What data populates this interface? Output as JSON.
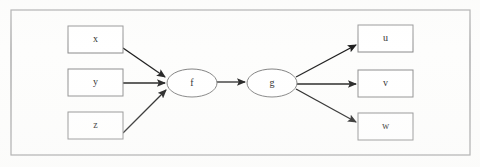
{
  "diagram": {
    "frame": {
      "name": "outer-border",
      "x": 11,
      "y": 10,
      "width": 459,
      "height": 145,
      "stroke": "#9a9a9a"
    },
    "colors": {
      "background": "#fdfdfc",
      "node_fill": "#ffffff",
      "node_stroke": "#8a8a8a",
      "ellipse_stroke": "#7d7d7d",
      "edge": "#1b1b1b",
      "label_text": "#1d1d1d"
    },
    "inputs": [
      {
        "id": "x",
        "label": "x",
        "shape": "rect",
        "x": 68,
        "y": 26,
        "width": 55,
        "height": 27
      },
      {
        "id": "y",
        "label": "y",
        "shape": "rect",
        "x": 68,
        "y": 69,
        "width": 55,
        "height": 27
      },
      {
        "id": "z",
        "label": "z",
        "shape": "rect",
        "x": 68,
        "y": 112,
        "width": 55,
        "height": 27
      }
    ],
    "functions": [
      {
        "id": "f",
        "label": "f",
        "shape": "ellipse",
        "cx": 192,
        "cy": 83,
        "rx": 25,
        "ry": 14
      },
      {
        "id": "g",
        "label": "g",
        "shape": "ellipse",
        "cx": 272,
        "cy": 83,
        "rx": 25,
        "ry": 14
      }
    ],
    "outputs": [
      {
        "id": "u",
        "label": "u",
        "shape": "rect",
        "x": 358,
        "y": 25,
        "width": 55,
        "height": 27
      },
      {
        "id": "v",
        "label": "v",
        "shape": "rect",
        "x": 358,
        "y": 70,
        "width": 55,
        "height": 27
      },
      {
        "id": "w",
        "label": "w",
        "shape": "rect",
        "x": 358,
        "y": 113,
        "width": 55,
        "height": 27
      }
    ],
    "edges": [
      {
        "id": "x-to-f",
        "from": "x",
        "to": "f",
        "x1": 123,
        "y1": 48,
        "x2": 165,
        "y2": 77
      },
      {
        "id": "y-to-f",
        "from": "y",
        "to": "f",
        "x1": 123,
        "y1": 83,
        "x2": 165,
        "y2": 83
      },
      {
        "id": "z-to-f",
        "from": "z",
        "to": "f",
        "x1": 123,
        "y1": 133,
        "x2": 166,
        "y2": 90
      },
      {
        "id": "f-to-g",
        "from": "f",
        "to": "g",
        "x1": 217,
        "y1": 82,
        "x2": 245,
        "y2": 82
      },
      {
        "id": "g-to-u",
        "from": "g",
        "to": "u",
        "x1": 296,
        "y1": 77,
        "x2": 356,
        "y2": 45
      },
      {
        "id": "g-to-v",
        "from": "g",
        "to": "v",
        "x1": 297,
        "y1": 84,
        "x2": 356,
        "y2": 84
      },
      {
        "id": "g-to-w",
        "from": "g",
        "to": "w",
        "x1": 296,
        "y1": 89,
        "x2": 356,
        "y2": 122
      }
    ]
  }
}
